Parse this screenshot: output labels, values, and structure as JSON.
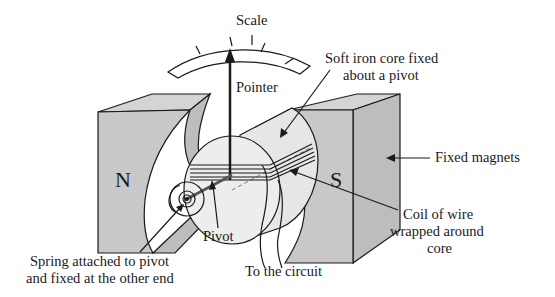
{
  "diagram": {
    "labels": {
      "scale": "Scale",
      "pointer": "Pointer",
      "soft_iron_core_line1": "Soft iron core fixed",
      "soft_iron_core_line2": "about a pivot",
      "north_pole": "N",
      "south_pole": "S",
      "fixed_magnets": "Fixed magnets",
      "coil_line1": "Coil of wire",
      "coil_line2": "wrapped around",
      "coil_line3": "core",
      "pivot": "Pivot",
      "to_circuit": "To the circuit",
      "spring_line1": "Spring attached to pivot",
      "spring_line2": "and fixed at the other end"
    },
    "colors": {
      "magnet_fill": "#c8c8c8",
      "core_fill": "#e6e6e6",
      "line": "#1a1a1a",
      "background": "#ffffff"
    }
  }
}
